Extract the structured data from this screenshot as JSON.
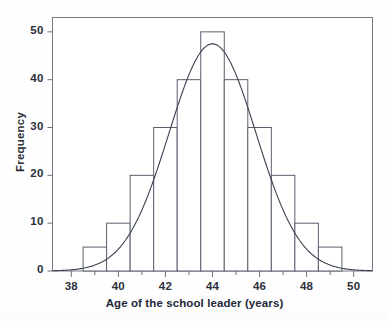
{
  "chart_data": {
    "type": "bar",
    "title": "",
    "subtitle": "",
    "xlabel": "Age of the school leader (years)",
    "ylabel": "Frequency",
    "xlim": [
      37.2,
      50.8
    ],
    "ylim": [
      0,
      53
    ],
    "xticks": [
      38,
      40,
      42,
      44,
      46,
      48,
      50
    ],
    "xtick_labels": [
      "38",
      "40",
      "42",
      "44",
      "46",
      "48",
      "50"
    ],
    "x_minor_ticks": [
      39,
      41,
      43,
      45,
      47,
      49
    ],
    "yticks": [
      0,
      10,
      20,
      30,
      40,
      50
    ],
    "ytick_labels": [
      "0",
      "10",
      "20",
      "30",
      "40",
      "50"
    ],
    "grid": false,
    "legend": null,
    "bin_width": 1,
    "bin_edges": [
      38.5,
      39.5,
      40.5,
      41.5,
      42.5,
      43.5,
      44.5,
      45.5,
      46.5,
      47.5,
      48.5,
      49.5
    ],
    "categories": [
      "39",
      "40",
      "41",
      "42",
      "43",
      "44",
      "45",
      "46",
      "47",
      "48",
      "49"
    ],
    "values": [
      5,
      10,
      20,
      30,
      40,
      50,
      40,
      30,
      20,
      10,
      5
    ],
    "overlay_curve": {
      "name": "normal-curve",
      "type": "line",
      "mean": 44,
      "peak_value": 47.5,
      "sd": 1.85
    },
    "colors": {
      "bar_edge": "#5a5f6e",
      "bar_fill": "#ffffff",
      "curve": "#3c4150",
      "axis": "#6e727d",
      "text": "#23283a",
      "background": "#fefefe"
    }
  }
}
